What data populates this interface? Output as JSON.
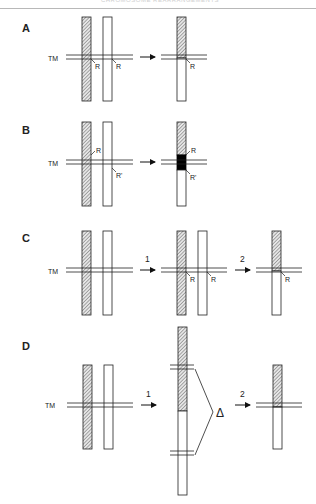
{
  "header": {
    "text": "CHROMOSOME REARRANGEMENTS"
  },
  "panels": [
    {
      "id": "A",
      "label": "A",
      "tm_label": "TM",
      "site_labels_left": [
        "R",
        "R"
      ],
      "site_labels_right": [
        "R"
      ]
    },
    {
      "id": "B",
      "label": "B",
      "tm_label": "TM",
      "site_labels_left": [
        "R",
        "R'"
      ],
      "site_labels_right": [
        "R",
        "R'"
      ]
    },
    {
      "id": "C",
      "label": "C",
      "tm_label": "TM",
      "step_labels": [
        "1",
        "2"
      ],
      "site_labels_middle": [
        "R",
        "R"
      ],
      "site_labels_right": [
        "R"
      ]
    },
    {
      "id": "D",
      "label": "D",
      "tm_label": "TM",
      "step_labels": [
        "1",
        "2"
      ],
      "deletion_label": "Δ"
    }
  ],
  "colors": {
    "line": "#222222",
    "hatch": "#555555",
    "block": "#000000",
    "background": "#ffffff"
  }
}
